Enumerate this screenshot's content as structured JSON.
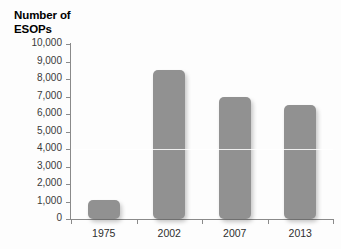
{
  "chart_data": {
    "type": "bar",
    "title": "Number of\nESOPs",
    "xlabel": "",
    "ylabel": "",
    "categories": [
      "1975",
      "2002",
      "2007",
      "2013"
    ],
    "values": [
      1100,
      8500,
      6950,
      6500
    ],
    "ylim": [
      0,
      10000
    ],
    "y_ticks": [
      0,
      1000,
      2000,
      3000,
      4000,
      5000,
      6000,
      7000,
      8000,
      9000,
      10000
    ],
    "y_tick_labels": [
      "0",
      "1,000",
      "2,000",
      "3,000",
      "4,000",
      "5,000",
      "6,000",
      "7,000",
      "8,000",
      "9,000",
      "10,000"
    ],
    "grid": false,
    "highlight_gridline": 4000,
    "legend": null,
    "bar_color": "#919191",
    "axis_color": "#8a8a8a",
    "text_color": "#2e2e2e",
    "background": "#fdfdfd"
  }
}
